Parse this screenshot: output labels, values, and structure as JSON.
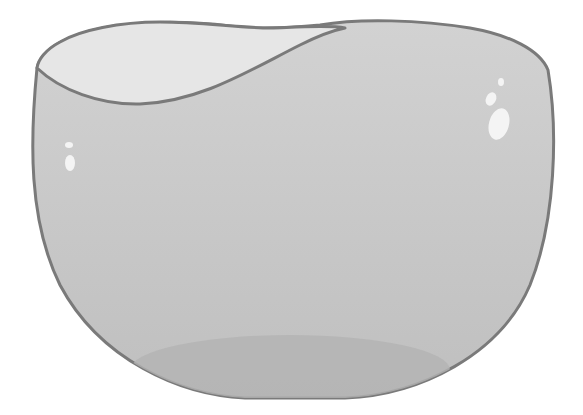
{
  "illustration": {
    "subject": "glass bowl",
    "colors": {
      "background": "#ffffff",
      "outline": "#7a7a7a",
      "body_top": "#cfcfcf",
      "body_bottom": "#bdbdbd",
      "rim_inner": "#e6e6e6",
      "base_shadow": "#b3b3b3",
      "highlight": "#f4f4f4"
    }
  }
}
